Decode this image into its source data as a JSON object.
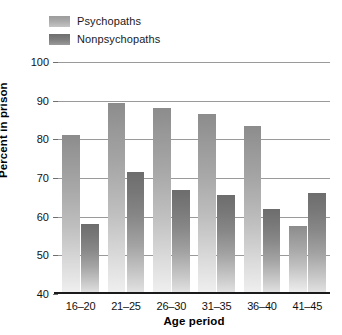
{
  "chart_data": {
    "type": "bar",
    "title": "",
    "subtitle": "",
    "xlabel": "Age period",
    "ylabel": "Percent in prison",
    "categories": [
      "16–20",
      "21–25",
      "26–30",
      "31–35",
      "36–40",
      "41–45"
    ],
    "series": [
      {
        "name": "Psychopaths",
        "color": "#a0a0a0",
        "values": [
          81,
          89.5,
          88,
          86.5,
          83.5,
          57.5
        ]
      },
      {
        "name": "Nonpsychopaths",
        "color": "#757575",
        "values": [
          58,
          71.5,
          67,
          65.5,
          62,
          66
        ]
      }
    ],
    "ylim": [
      40,
      100
    ],
    "ytick_step": 10,
    "yticks": [
      40,
      50,
      60,
      70,
      80,
      90,
      100
    ],
    "grid": "horizontal",
    "legend_position": "top-left"
  },
  "legend": {
    "items": [
      {
        "label": "Psychopaths"
      },
      {
        "label": "Nonpsychopaths"
      }
    ]
  }
}
